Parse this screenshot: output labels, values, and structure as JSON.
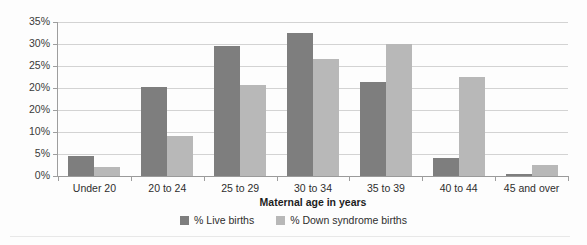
{
  "chart_data": {
    "type": "bar",
    "title": "",
    "xlabel": "Maternal age in years",
    "ylabel": "",
    "categories": [
      "Under 20",
      "20 to 24",
      "25 to 29",
      "30 to 34",
      "35 to 39",
      "40 to 44",
      "45 and over"
    ],
    "series": [
      {
        "name": "% Live births",
        "color": "#7e7e7e",
        "values": [
          4.5,
          20.3,
          29.5,
          32.5,
          21.4,
          4.0,
          0.5
        ]
      },
      {
        "name": "% Down syndrome births",
        "color": "#b8b8b8",
        "values": [
          2.0,
          9.0,
          20.6,
          26.7,
          30.0,
          22.4,
          2.5
        ]
      }
    ],
    "ylim": [
      0,
      35
    ],
    "y_tick_values": [
      35,
      30,
      25,
      20,
      15,
      10,
      5,
      0
    ],
    "y_tick_labels": [
      "35%",
      "30%",
      "25%",
      "20%",
      "20%",
      "10%",
      "5%",
      "0%"
    ],
    "grid": true,
    "legend_position": "bottom"
  }
}
